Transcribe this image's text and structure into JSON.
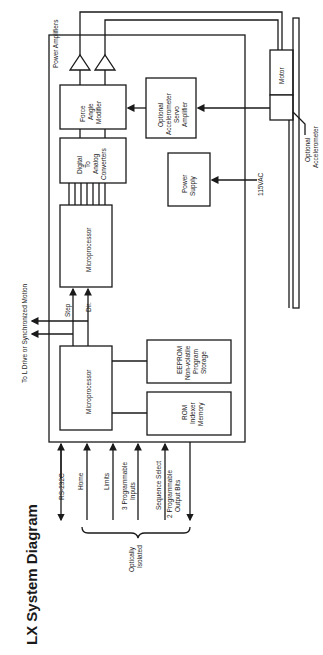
{
  "title": "LX System Diagram",
  "blocks": {
    "power_amplifiers": "Power Amplifiers",
    "force_angle_modifier": [
      "Force",
      "Angle",
      "Modifier"
    ],
    "dac": [
      "Digital",
      "To",
      "Analog",
      "Converters"
    ],
    "microprocessor_top": "Microprocessor",
    "microprocessor_bottom": "Microprocessor",
    "eeprom": [
      "EEPROM",
      "Non-volatile",
      "Program",
      "Storage"
    ],
    "rom": [
      "ROM",
      "Indexer",
      "Memory"
    ],
    "accel_servo_amp": [
      "Optional",
      "Accelerometer",
      "Servo",
      "Amplifier"
    ],
    "power_supply": [
      "Power",
      "Supply"
    ],
    "motor": "Motor",
    "optional_accelerometer": [
      "Optional",
      "Accelerometer"
    ]
  },
  "signals": {
    "step": "Step",
    "dir": "Dir.",
    "to_l_drive": "To L Drive or Synchronized Motion",
    "vac": "115VAC"
  },
  "io": {
    "rs232": "RS-232C",
    "home": "Home",
    "limits": "Limits",
    "prog_inputs": [
      "3 Programmable",
      "Inputs"
    ],
    "sequence_select": "Sequence Select",
    "prog_outputs": [
      "2 Programmable",
      "Output Bits"
    ],
    "optically_isolated": [
      "Optically",
      "Isolated"
    ]
  }
}
